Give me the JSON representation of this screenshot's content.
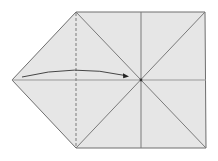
{
  "diagram": {
    "type": "origami-fold-step",
    "colors": {
      "paper_fill": "#e6e6e6",
      "crease_line": "#7a7a7a",
      "outline": "#6e6e6e",
      "arrow": "#333333",
      "background": "#ffffff"
    },
    "shape": {
      "points": [
        [
          12,
          80
        ],
        [
          76,
          12
        ],
        [
          205,
          12
        ],
        [
          206,
          148
        ],
        [
          76,
          148
        ]
      ]
    },
    "fold_line": {
      "type": "valley-dashed",
      "x": 76,
      "y1": 12,
      "y2": 148
    },
    "creases": [
      {
        "x1": 76,
        "y1": 12,
        "x2": 206,
        "y2": 148
      },
      {
        "x1": 76,
        "y1": 148,
        "x2": 205,
        "y2": 12
      },
      {
        "x1": 141,
        "y1": 12,
        "x2": 141,
        "y2": 148
      },
      {
        "x1": 12,
        "y1": 80,
        "x2": 206,
        "y2": 80
      }
    ],
    "center_point": [
      141,
      80
    ],
    "arrow": {
      "from": [
        22,
        77
      ],
      "control": [
        75,
        64
      ],
      "to": [
        128,
        76
      ],
      "meaning": "fold left point to center"
    }
  }
}
